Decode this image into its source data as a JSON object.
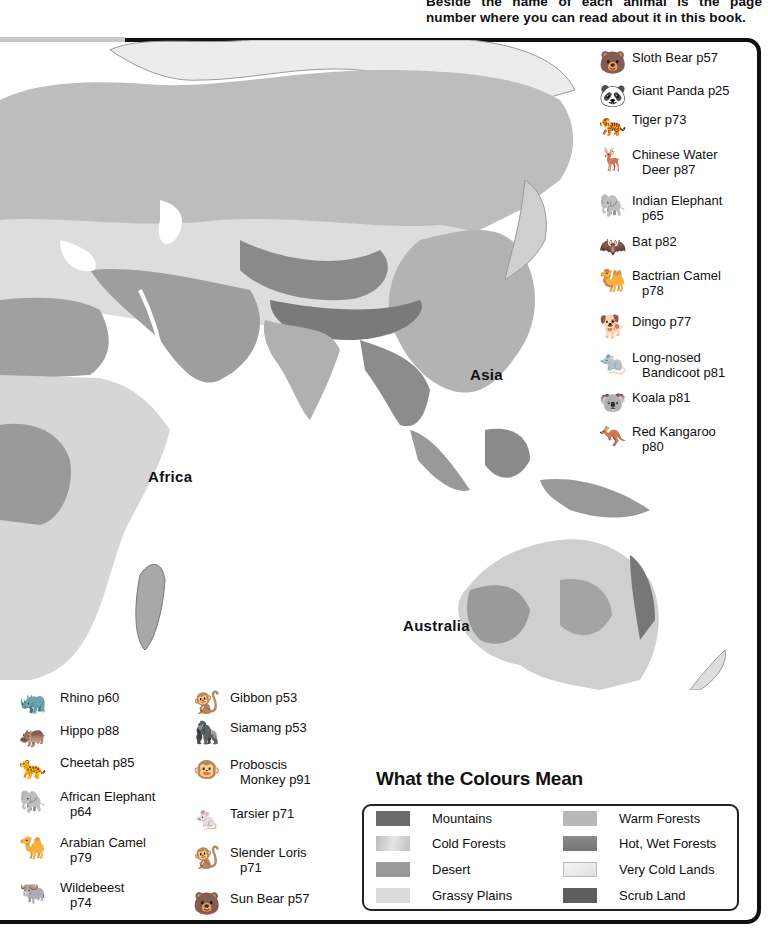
{
  "intro_text": "Beside the name of each animal is the page number where you can read about it in this book.",
  "regions": [
    {
      "label": "Africa",
      "x": 148,
      "y": 468
    },
    {
      "label": "Asia",
      "x": 470,
      "y": 366
    },
    {
      "label": "Australia",
      "x": 403,
      "y": 617
    }
  ],
  "animal_key_right": [
    {
      "icon": "bear-icon",
      "glyph": "🐻",
      "line1": "Sloth Bear p57",
      "line2": "",
      "y": 50
    },
    {
      "icon": "panda-icon",
      "glyph": "🐼",
      "line1": "Giant Panda p25",
      "line2": "",
      "y": 83
    },
    {
      "icon": "tiger-icon",
      "glyph": "🐅",
      "line1": "Tiger p73",
      "line2": "",
      "y": 112
    },
    {
      "icon": "deer-icon",
      "glyph": "🦌",
      "line1": "Chinese Water",
      "line2": "Deer p87",
      "y": 147
    },
    {
      "icon": "elephant-icon",
      "glyph": "🐘",
      "line1": "Indian Elephant",
      "line2": "p65",
      "y": 193
    },
    {
      "icon": "bat-icon",
      "glyph": "🦇",
      "line1": "Bat p82",
      "line2": "",
      "y": 234
    },
    {
      "icon": "camel-icon",
      "glyph": "🐫",
      "line1": "Bactrian Camel",
      "line2": "p78",
      "y": 268
    },
    {
      "icon": "dingo-icon",
      "glyph": "🐕",
      "line1": "Dingo p77",
      "line2": "",
      "y": 314
    },
    {
      "icon": "bandicoot-icon",
      "glyph": "🐀",
      "line1": "Long-nosed",
      "line2": "Bandicoot p81",
      "y": 350
    },
    {
      "icon": "koala-icon",
      "glyph": "🐨",
      "line1": "Koala p81",
      "line2": "",
      "y": 390
    },
    {
      "icon": "kangaroo-icon",
      "glyph": "🦘",
      "line1": "Red Kangaroo",
      "line2": "p80",
      "y": 424
    }
  ],
  "animal_key_bottom_left": [
    {
      "icon": "rhino-icon",
      "glyph": "🦏",
      "line1": "Rhino p60",
      "line2": "",
      "y": 690
    },
    {
      "icon": "hippo-icon",
      "glyph": "🦛",
      "line1": "Hippo p88",
      "line2": "",
      "y": 723
    },
    {
      "icon": "cheetah-icon",
      "glyph": "🐆",
      "line1": "Cheetah p85",
      "line2": "",
      "y": 755
    },
    {
      "icon": "elephant-icon",
      "glyph": "🐘",
      "line1": "African Elephant",
      "line2": "p64",
      "y": 789
    },
    {
      "icon": "camel-icon",
      "glyph": "🐪",
      "line1": "Arabian Camel",
      "line2": "p79",
      "y": 835
    },
    {
      "icon": "wildebeest-icon",
      "glyph": "🐃",
      "line1": "Wildebeest",
      "line2": "p74",
      "y": 880
    }
  ],
  "animal_key_bottom_mid": [
    {
      "icon": "gibbon-icon",
      "glyph": "🐒",
      "line1": "Gibbon p53",
      "line2": "",
      "y": 690
    },
    {
      "icon": "siamang-icon",
      "glyph": "🦍",
      "line1": "Siamang p53",
      "line2": "",
      "y": 720
    },
    {
      "icon": "monkey-icon",
      "glyph": "🐵",
      "line1": "Proboscis",
      "line2": "Monkey p91",
      "y": 757
    },
    {
      "icon": "tarsier-icon",
      "glyph": "🐁",
      "line1": "Tarsier p71",
      "line2": "",
      "y": 806
    },
    {
      "icon": "loris-icon",
      "glyph": "🐒",
      "line1": "Slender Loris",
      "line2": "p71",
      "y": 845
    },
    {
      "icon": "bear-icon",
      "glyph": "🐻",
      "line1": "Sun Bear p57",
      "line2": "",
      "y": 891
    }
  ],
  "legend": {
    "title": "What the Colours Mean",
    "left": [
      {
        "label": "Mountains",
        "color": "#6a6a6a"
      },
      {
        "label": "Cold Forests",
        "color": "#c4c4c4"
      },
      {
        "label": "Desert",
        "color": "#999999"
      },
      {
        "label": "Grassy Plains",
        "color": "#dcdcdc"
      }
    ],
    "right": [
      {
        "label": "Warm Forests",
        "color": "#b8b8b8"
      },
      {
        "label": "Hot, Wet Forests",
        "color": "#7c7c7c"
      },
      {
        "label": "Very Cold Lands",
        "color": "#ececec"
      },
      {
        "label": "Scrub Land",
        "color": "#5e5e5e"
      }
    ]
  }
}
